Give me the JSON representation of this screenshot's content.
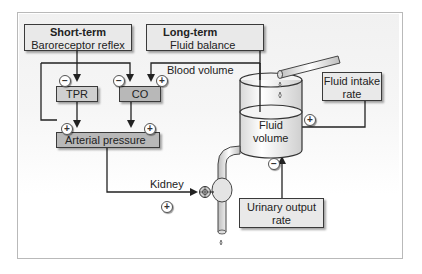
{
  "diagram": {
    "boxes": {
      "short_term": {
        "title": "Short-term",
        "subtitle": "Baroreceptor reflex"
      },
      "long_term": {
        "title": "Long-term",
        "subtitle": "Fluid balance"
      },
      "tpr": {
        "label": "TPR"
      },
      "co": {
        "label": "CO"
      },
      "arterial_pressure": {
        "label": "Arterial pressure"
      },
      "fluid_intake": {
        "line1": "Fluid intake",
        "line2": "rate"
      },
      "urinary_output": {
        "line1": "Urinary output",
        "line2": "rate"
      }
    },
    "labels": {
      "blood_volume": "Blood volume",
      "kidney": "Kidney",
      "fluid_volume_1": "Fluid",
      "fluid_volume_2": "volume"
    },
    "signs": {
      "short_to_tpr": "−",
      "short_to_co": "−",
      "long_to_co": "+",
      "tpr_to_ap": "+",
      "co_to_ap": "+",
      "intake_to_volume": "+",
      "ap_to_kidney": "+",
      "output_to_volume": "−"
    },
    "colors": {
      "box_light": "#e9e9e9",
      "box_mid": "#cfcfcf",
      "box_dark": "#b8b8b8",
      "line": "#222222"
    }
  }
}
